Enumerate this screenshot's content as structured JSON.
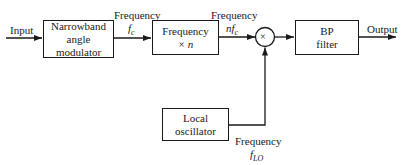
{
  "diagram": {
    "input_label": "Input",
    "output_label": "Output",
    "blocks": [
      {
        "id": "narrowband",
        "line1": "Narrowband",
        "line2": "angle modulator"
      },
      {
        "id": "multiplier",
        "line1": "Frequency",
        "line2": "× n"
      },
      {
        "id": "mixer",
        "symbol": "×"
      },
      {
        "id": "bp_filter",
        "line1": "BP",
        "line2": "filter"
      },
      {
        "id": "local_osc",
        "line1": "Local",
        "line2": "oscillator"
      }
    ],
    "signals": [
      {
        "label": "Frequency",
        "value": "fc"
      },
      {
        "label": "Frequency",
        "value": "nfc"
      },
      {
        "label": "Frequency",
        "value": "fLO"
      }
    ]
  }
}
